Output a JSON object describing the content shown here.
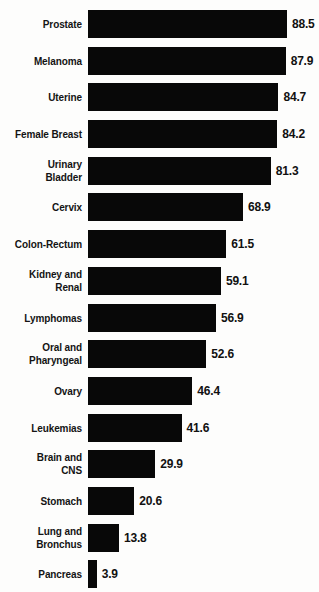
{
  "chart_data": {
    "type": "bar",
    "orientation": "horizontal",
    "title": "",
    "subtitle": "",
    "xlabel": "",
    "ylabel": "",
    "xlim": [
      0,
      88.5
    ],
    "grid": false,
    "legend": null,
    "bar_color": "#080808",
    "background_color": "#fdfdfc",
    "text_color": "#141414",
    "value_label_format": "one-decimal",
    "categories": [
      "Prostate",
      "Melanoma",
      "Uterine",
      "Female Breast",
      "Urinary Bladder",
      "Cervix",
      "Colon-Rectum",
      "Kidney and Renal",
      "Lymphomas",
      "Oral and Pharyngeal",
      "Ovary",
      "Leukemias",
      "Brain and CNS",
      "Stomach",
      "Lung and Bronchus",
      "Pancreas"
    ],
    "values": [
      88.5,
      87.9,
      84.7,
      84.2,
      81.3,
      68.9,
      61.5,
      59.1,
      56.9,
      52.6,
      46.4,
      41.6,
      29.9,
      20.6,
      13.8,
      3.9
    ]
  },
  "rows": [
    {
      "label_lines": [
        "Prostate"
      ],
      "value": "88.5",
      "value_num": 88.5
    },
    {
      "label_lines": [
        "Melanoma"
      ],
      "value": "87.9",
      "value_num": 87.9
    },
    {
      "label_lines": [
        "Uterine"
      ],
      "value": "84.7",
      "value_num": 84.7
    },
    {
      "label_lines": [
        "Female Breast"
      ],
      "value": "84.2",
      "value_num": 84.2
    },
    {
      "label_lines": [
        "Urinary",
        "Bladder"
      ],
      "value": "81.3",
      "value_num": 81.3
    },
    {
      "label_lines": [
        "Cervix"
      ],
      "value": "68.9",
      "value_num": 68.9
    },
    {
      "label_lines": [
        "Colon-Rectum"
      ],
      "value": "61.5",
      "value_num": 61.5
    },
    {
      "label_lines": [
        "Kidney and",
        "Renal"
      ],
      "value": "59.1",
      "value_num": 59.1
    },
    {
      "label_lines": [
        "Lymphomas"
      ],
      "value": "56.9",
      "value_num": 56.9
    },
    {
      "label_lines": [
        "Oral and",
        "Pharyngeal"
      ],
      "value": "52.6",
      "value_num": 52.6
    },
    {
      "label_lines": [
        "Ovary"
      ],
      "value": "46.4",
      "value_num": 46.4
    },
    {
      "label_lines": [
        "Leukemias"
      ],
      "value": "41.6",
      "value_num": 41.6
    },
    {
      "label_lines": [
        "Brain and",
        "CNS"
      ],
      "value": "29.9",
      "value_num": 29.9
    },
    {
      "label_lines": [
        "Stomach"
      ],
      "value": "20.6",
      "value_num": 20.6
    },
    {
      "label_lines": [
        "Lung and",
        "Bronchus"
      ],
      "value": "13.8",
      "value_num": 13.8
    },
    {
      "label_lines": [
        "Pancreas"
      ],
      "value": "3.9",
      "value_num": 3.9
    }
  ],
  "layout": {
    "px_per_unit": 2.249,
    "bar_left": 88,
    "row_pitch": 36.7,
    "bar_height": 28
  }
}
